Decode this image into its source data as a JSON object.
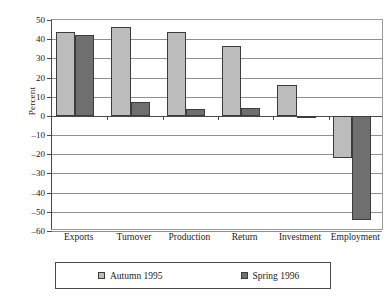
{
  "chart_data": {
    "type": "bar",
    "title": "",
    "subtitle": "",
    "xlabel": "",
    "ylabel": "Percent",
    "categories": [
      "Exports",
      "Turnover",
      "Production",
      "Return",
      "Investment",
      "Employment"
    ],
    "series": [
      {
        "name": "Autumn 1995",
        "color": "#bcbcbc",
        "values": [
          44,
          46.5,
          44,
          36.5,
          16,
          -22
        ]
      },
      {
        "name": "Spring 1996",
        "color": "#6f6f6f",
        "values": [
          42,
          7,
          3.5,
          4,
          -1,
          -54.5
        ]
      }
    ],
    "ylim": [
      -60,
      50
    ],
    "ytick_step": 10,
    "yticks": [
      50,
      40,
      30,
      20,
      10,
      0,
      -10,
      -20,
      -30,
      -40,
      -50,
      -60
    ],
    "ytick_labels": [
      "50",
      "40",
      "30",
      "20",
      "10",
      "0",
      "–10",
      "–20",
      "–30",
      "–40",
      "–50",
      "–60"
    ],
    "grid": true,
    "grid_axis": "y",
    "legend_position": "bottom",
    "zero_line": true
  },
  "axis": {
    "y_title": "Percent"
  },
  "legend": {
    "entries": [
      {
        "label": "Autumn 1995",
        "swatch": "legend-swatch-autumn"
      },
      {
        "label": "Spring 1996",
        "swatch": "legend-swatch-spring"
      }
    ]
  }
}
